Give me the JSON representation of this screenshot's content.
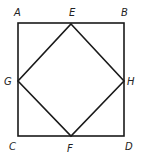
{
  "diagram": {
    "stroke_color": "#1a1a1a",
    "outer_square": {
      "vertices": [
        "A",
        "B",
        "D",
        "C"
      ],
      "points": {
        "A": [
          18,
          23
        ],
        "B": [
          124,
          23
        ],
        "C": [
          18,
          136
        ],
        "D": [
          124,
          136
        ]
      }
    },
    "inner_square": {
      "vertices": [
        "E",
        "H",
        "F",
        "G"
      ],
      "points": {
        "E": [
          71,
          24
        ],
        "H": [
          124,
          81
        ],
        "F": [
          71,
          136
        ],
        "G": [
          18,
          81
        ]
      }
    },
    "labels": {
      "A": "A",
      "B": "B",
      "C": "C",
      "D": "D",
      "E": "E",
      "F": "F",
      "G": "G",
      "H": "H"
    }
  }
}
